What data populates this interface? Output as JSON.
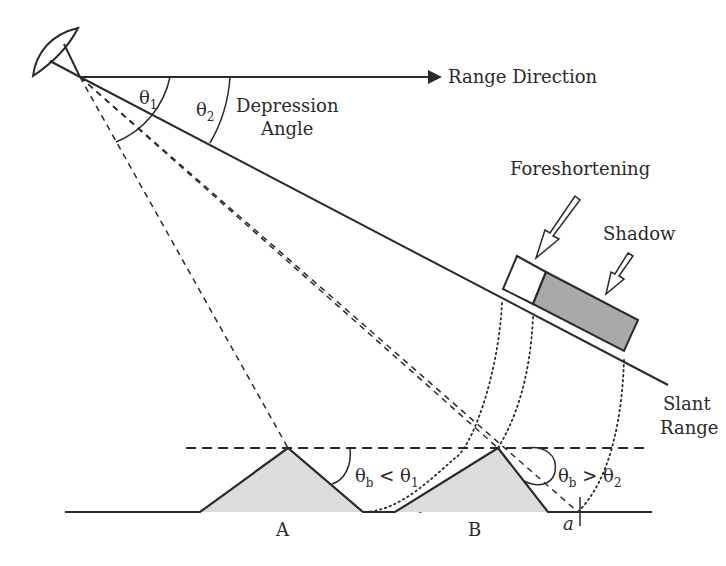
{
  "labels": {
    "range_direction": "Range Direction",
    "depression_line1": "Depression",
    "depression_line2": "Angle",
    "foreshortening": "Foreshortening",
    "shadow": "Shadow",
    "slant_line1": "Slant",
    "slant_line2": "Range",
    "point_a": "A",
    "point_b": "B",
    "point_small_a": "a"
  },
  "angles": {
    "theta1": {
      "symbol": "θ",
      "sub": "1"
    },
    "theta2": {
      "symbol": "θ",
      "sub": "2"
    },
    "cond_a": {
      "lhs": "θ",
      "lhs_sub": "b",
      "op": " < ",
      "rhs": "θ",
      "rhs_sub": "1"
    },
    "cond_b": {
      "lhs": "θ",
      "lhs_sub": "b",
      "op": " > ",
      "rhs": "θ",
      "rhs_sub": "2"
    }
  },
  "colors": {
    "stroke": "#2a2a2a",
    "mountain_fill": "#dcdcdc",
    "shadow_fill": "#a9a9a9",
    "foreshortening_fill": "#ffffff"
  }
}
